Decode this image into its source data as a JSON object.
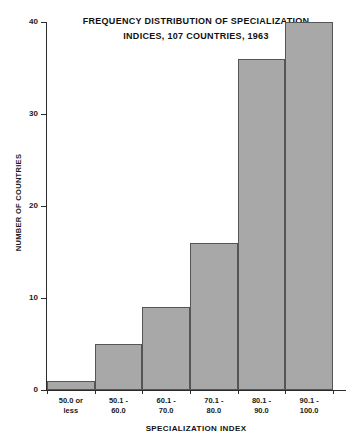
{
  "chart_data": {
    "type": "bar",
    "title": "FREQUENCY DISTRIBUTION OF SPECIALIZATION INDICES, 107 COUNTRIES, 1963",
    "title_lines": [
      "FREQUENCY  DISTRIBUTION  OF  SPECIALIZATION",
      "INDICES, 107 COUNTRIES, 1963"
    ],
    "xlabel": "SPECIALIZATION INDEX",
    "ylabel": "NUMBER OF COUNTRIES",
    "categories": [
      "50.0 or less",
      "50.1 - 60.0",
      "60.1 - 70.0",
      "70.1 - 80.0",
      "80.1 - 90.0",
      "90.1 - 100.0"
    ],
    "category_lines": [
      [
        "50.0 or",
        "less"
      ],
      [
        "50.1 -",
        "60.0"
      ],
      [
        "60.1 -",
        "70.0"
      ],
      [
        "70.1 -",
        "80.0"
      ],
      [
        "80.1 -",
        "90.0"
      ],
      [
        "90.1 -",
        "100.0"
      ]
    ],
    "values": [
      1,
      5,
      9,
      16,
      36,
      40
    ],
    "ylim": [
      0,
      40
    ],
    "yticks": [
      0,
      10,
      20,
      30,
      40
    ],
    "ytick_labels": [
      "0",
      "10",
      "20",
      "30",
      "40"
    ],
    "grid": false,
    "legend": false,
    "bar_color": "#a8a8a8",
    "bar_edge_color": "#555555",
    "axis_color": "#2b2b2b",
    "background_color": "#ffffff"
  }
}
